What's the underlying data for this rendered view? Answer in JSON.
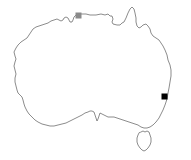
{
  "figure": {
    "background_color": "#ffffff",
    "width": 191,
    "height": 160
  },
  "map": {
    "region_name": "Australia",
    "outline_color": "#5a5a5a",
    "outline_width": 0.7,
    "fill_color": "none",
    "landmasses": [
      {
        "name": "mainland-australia",
        "label": "Mainland Australia"
      },
      {
        "name": "tasmania",
        "label": "Tasmania"
      }
    ]
  },
  "markers": [
    {
      "name": "marker-north",
      "label": "Northern marker",
      "shape": "square",
      "color": "#8a8a8a",
      "x": 75.5,
      "y": 12.5,
      "size": 6.0
    },
    {
      "name": "marker-east",
      "label": "Eastern marker",
      "shape": "square",
      "color": "#000000",
      "x": 161.5,
      "y": 93.5,
      "size": 6.0
    }
  ],
  "chart_data": {
    "type": "scatter",
    "xlabel": "",
    "ylabel": "",
    "xlim": [
      0,
      191
    ],
    "ylim": [
      0,
      160
    ],
    "grid": false,
    "legend": "none",
    "series": [
      {
        "name": "markers",
        "points": [
          {
            "x": 78.5,
            "y": 15.5,
            "color": "#8a8a8a",
            "marker": "square"
          },
          {
            "x": 164.5,
            "y": 96.5,
            "color": "#000000",
            "marker": "square"
          }
        ]
      }
    ],
    "annotations": []
  }
}
